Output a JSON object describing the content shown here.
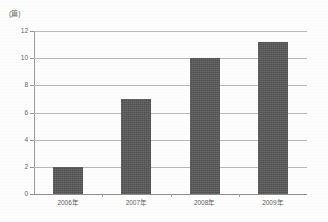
{
  "chart_data": {
    "type": "bar",
    "title": "",
    "subtitle": "",
    "xlabel": "",
    "ylabel": "(篇)",
    "categories": [
      "2006年",
      "2007年",
      "2008年",
      "2009年"
    ],
    "values": [
      2,
      7,
      10,
      11.2
    ],
    "ylim": [
      0,
      12
    ],
    "ytick_values": [
      0,
      2,
      4,
      6,
      8,
      10,
      12
    ],
    "ytick_labels": [
      "0",
      "2",
      "4",
      "6",
      "8",
      "10",
      "12"
    ],
    "grid": "horizontal",
    "legend": "none",
    "bar_color": "#595959",
    "gridline_color": "#b9b9b9",
    "axis_color": "#9a9a9a",
    "background_color": "#fdfdfd",
    "text_color": "#666666"
  },
  "axes": {
    "y_unit_caption": "(篇)"
  }
}
